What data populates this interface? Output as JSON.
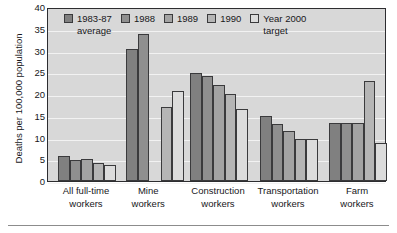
{
  "chart_data": {
    "type": "bar",
    "title": "",
    "xlabel": "",
    "ylabel": "Deaths per 100,000 population",
    "ylim": [
      0,
      40
    ],
    "ytick_step": 5,
    "yticks": [
      "40",
      "35",
      "30",
      "25",
      "20",
      "15",
      "10",
      "5",
      "0"
    ],
    "grid": true,
    "legend_position": "top-inside",
    "categories": [
      "All full-time\nworkers",
      "Mine\nworkers",
      "Construction\nworkers",
      "Transportation\nworkers",
      "Farm\nworkers"
    ],
    "series": [
      {
        "name": "1983-87\naverage",
        "color": "#808080",
        "values": [
          5.7,
          30.3,
          24.9,
          14.9,
          13.4
        ]
      },
      {
        "name": "1988",
        "color": "#8f8f8f",
        "values": [
          4.8,
          33.8,
          24.1,
          13.2,
          13.4
        ]
      },
      {
        "name": "1989",
        "color": "#a3a3a3",
        "values": [
          5.1,
          null,
          22.0,
          11.6,
          13.4
        ]
      },
      {
        "name": "1990",
        "color": "#b5b5b5",
        "values": [
          4.2,
          17.0,
          20.1,
          9.6,
          22.9
        ]
      },
      {
        "name": "Year 2000\ntarget",
        "color": "#dcdcdc",
        "values": [
          3.6,
          20.7,
          16.5,
          9.6,
          8.7
        ]
      }
    ],
    "plot_background": "#d8d8d8",
    "gridline_color": "#f2f2f2",
    "axis_color": "#2d2d30"
  }
}
